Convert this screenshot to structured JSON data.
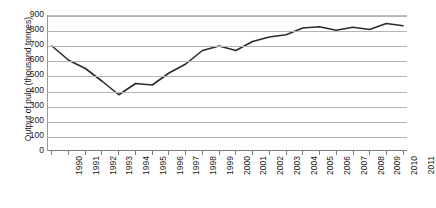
{
  "chart_data": {
    "type": "line",
    "title": "",
    "xlabel": "",
    "ylabel": "Output of pulp (thousand tonnes)",
    "ylim": [
      0,
      900
    ],
    "ytick_step": 100,
    "grid": true,
    "legend": "none",
    "line_color": "#2b2b2b",
    "categories": [
      "1990",
      "1991",
      "1992",
      "1993",
      "1994",
      "1995",
      "1996",
      "1997",
      "1998",
      "1999",
      "2000",
      "2001",
      "2002",
      "2003",
      "2004",
      "2005",
      "2006",
      "2007",
      "2008",
      "2009",
      "2010",
      "2011"
    ],
    "yticks": [
      "900",
      "800",
      "700",
      "600",
      "500",
      "400",
      "300",
      "200",
      "100",
      "0"
    ],
    "values": [
      700,
      605,
      550,
      465,
      375,
      450,
      440,
      520,
      580,
      670,
      700,
      670,
      730,
      760,
      775,
      820,
      828,
      805,
      825,
      810,
      850,
      835
    ],
    "series": [
      {
        "name": "Output of pulp",
        "values": [
          700,
          605,
          550,
          465,
          375,
          450,
          440,
          520,
          580,
          670,
          700,
          670,
          730,
          760,
          775,
          820,
          828,
          805,
          825,
          810,
          850,
          835
        ]
      }
    ]
  }
}
